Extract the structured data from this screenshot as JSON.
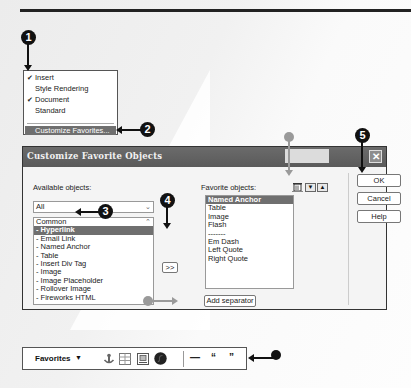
{
  "callouts": [
    "1",
    "2",
    "3",
    "4",
    "5"
  ],
  "context_menu": {
    "items": [
      {
        "label": "Insert",
        "checked": true
      },
      {
        "label": "Style Rendering",
        "checked": false
      },
      {
        "label": "Document",
        "checked": true
      },
      {
        "label": "Standard",
        "checked": false
      }
    ],
    "highlighted": "Customize Favorites...",
    "check_glyph": "✔"
  },
  "dialog": {
    "title": "Customize Favorite Objects",
    "close_glyph": "✕",
    "available_label": "Available objects:",
    "favorite_label": "Favorite objects:",
    "category_select": "All",
    "available_items": [
      "Common",
      "- Hyperlink",
      "- Email Link",
      "- Named Anchor",
      "- Table",
      "- Insert Div Tag",
      "- Image",
      "- Image Placeholder",
      "- Rollover Image",
      "- Fireworks HTML"
    ],
    "available_selected_index": 1,
    "favorite_items": [
      "Named Anchor",
      "Table",
      "Image",
      "Flash",
      "-------",
      "Em Dash",
      "Left Quote",
      "Right Quote"
    ],
    "favorite_selected_index": 0,
    "add_button": ">>",
    "add_separator_button": "Add separator",
    "move_down_glyph": "▼",
    "move_up_glyph": "▲",
    "ok_button": "OK",
    "cancel_button": "Cancel",
    "help_button": "Help"
  },
  "toolbar": {
    "label": "Favorites",
    "caret": "▼",
    "em_dash": "—",
    "left_quote": "“",
    "right_quote": "”"
  },
  "colors": {
    "titlebar": "#5f5f5f",
    "selection": "#6f6f6f",
    "callout": "#111111",
    "callout_gray": "#9a9a9a"
  }
}
